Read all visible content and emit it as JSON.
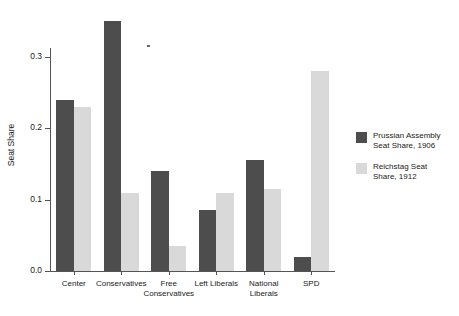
{
  "chart_data": {
    "type": "bar",
    "title": "",
    "xlabel": "",
    "ylabel": "Seat Share",
    "ylim": [
      0.0,
      0.36
    ],
    "yticks": [
      0.0,
      0.1,
      0.2,
      0.3
    ],
    "ytick_labels": [
      "0.0",
      "0.1",
      "0.2",
      "0.3"
    ],
    "grid": false,
    "legend_position": "right",
    "categories": [
      "Center",
      "Conservatives",
      "Free\nConservatives",
      "Left Liberals",
      "National\nLiberals",
      "SPD"
    ],
    "series": [
      {
        "name": "Prussian Assembly\nSeat Share, 1906",
        "color": "#4d4d4d",
        "values": [
          0.24,
          0.35,
          0.14,
          0.085,
          0.155,
          0.02
        ]
      },
      {
        "name": "Reichstag Seat\nShare, 1912",
        "color": "#d9d9d9",
        "values": [
          0.23,
          0.11,
          0.035,
          0.11,
          0.115,
          0.28
        ]
      }
    ]
  },
  "legend": {
    "items": [
      {
        "label": "Prussian Assembly\nSeat Share, 1906",
        "swatch": "dark"
      },
      {
        "label": "Reichstag Seat\nShare, 1912",
        "swatch": "light"
      }
    ]
  },
  "axes": {
    "y_title": "Seat Share"
  }
}
